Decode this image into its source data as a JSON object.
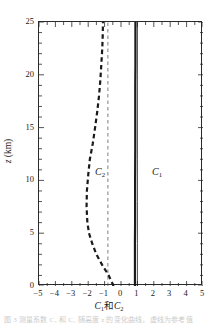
{
  "chart_data": {
    "type": "line",
    "title": "",
    "xlabel": "C₁和C₂",
    "ylabel": "z (km)",
    "xlim": [
      -5,
      5
    ],
    "ylim": [
      0,
      25
    ],
    "xticks": [
      "-5",
      "-4",
      "-3",
      "-2",
      "-1",
      "0",
      "1",
      "2",
      "3",
      "4",
      "5"
    ],
    "xtick_values": [
      -5,
      -4,
      -3,
      -2,
      -1,
      0,
      1,
      2,
      3,
      4,
      5
    ],
    "yticks": [
      "0",
      "5",
      "10",
      "15",
      "20",
      "25"
    ],
    "ytick_values": [
      0,
      5,
      10,
      15,
      20,
      25
    ],
    "minor_tick_step_x": 0.5,
    "minor_tick_step_y": 1,
    "tick_direction": "in",
    "grid": false,
    "legend": "inline-labels",
    "orientation": "vertical-profile",
    "series": [
      {
        "name": "C₁",
        "label": "C₁",
        "style": "solid",
        "width": 2.2,
        "color": "#1a1a1a",
        "x": [
          0.85,
          0.85,
          0.85,
          0.86,
          0.86,
          0.86,
          0.87,
          0.87,
          0.87,
          0.88,
          0.88,
          0.88
        ],
        "y": [
          0,
          2,
          4,
          6,
          8,
          10,
          13,
          16,
          19,
          21,
          23,
          25
        ]
      },
      {
        "name": "C₁-thin",
        "label": "",
        "style": "solid",
        "width": 0.8,
        "color": "#1a1a1a",
        "x": [
          1.0,
          1.0,
          1.0,
          1.0,
          1.0,
          1.0,
          1.0
        ],
        "y": [
          0,
          4,
          8,
          12,
          16,
          20,
          25
        ]
      },
      {
        "name": "C₂",
        "label": "C₂",
        "style": "dashed",
        "width": 2.2,
        "color": "#1a1a1a",
        "x": [
          -0.45,
          -0.75,
          -1.15,
          -1.5,
          -1.75,
          -1.95,
          -2.05,
          -2.1,
          -2.08,
          -2.0,
          -1.9,
          -1.72,
          -1.58,
          -1.45,
          -1.34,
          -1.26,
          -1.2,
          -1.16,
          -1.13,
          -1.11,
          -1.1
        ],
        "y": [
          0,
          1,
          2,
          3,
          4,
          5,
          6,
          7.5,
          9,
          10.5,
          12,
          13.5,
          15,
          16.5,
          18,
          19.5,
          21,
          22,
          23,
          24,
          25
        ]
      },
      {
        "name": "reference",
        "label": "",
        "style": "dashed-thin",
        "width": 0.7,
        "color": "#4a4a4a",
        "x": [
          -0.8,
          -0.8
        ],
        "y": [
          0,
          25
        ]
      }
    ]
  },
  "caption": {
    "sliver_text": "图 3  测量系数 C₁ 和 C₂ 随高度 z 的变化曲线，虚线为参考值"
  }
}
